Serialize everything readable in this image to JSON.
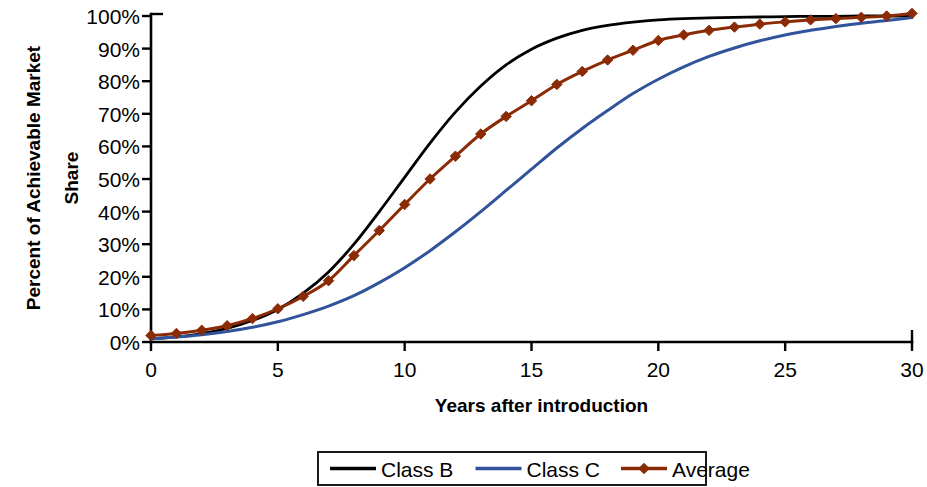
{
  "chart_data": {
    "type": "line",
    "title": "",
    "xlabel": "Years after introduction",
    "ylabel": "Percent of Achievable Market Share",
    "ylabel_lines": [
      "Percent of Achievable Market",
      "Share"
    ],
    "xlim": [
      0,
      30
    ],
    "ylim": [
      0,
      100
    ],
    "x_ticks": [
      0,
      5,
      10,
      15,
      20,
      25,
      30
    ],
    "x_tick_labels": [
      "0",
      "5",
      "10",
      "15",
      "20",
      "25",
      "30"
    ],
    "x_minor_ticks": [
      0,
      5,
      10,
      15,
      20,
      25,
      30
    ],
    "y_ticks": [
      0,
      10,
      20,
      30,
      40,
      50,
      60,
      70,
      80,
      90,
      100
    ],
    "y_tick_labels": [
      "0%",
      "10%",
      "20%",
      "30%",
      "40%",
      "50%",
      "60%",
      "70%",
      "80%",
      "90%",
      "100%"
    ],
    "grid": false,
    "legend_position": "bottom",
    "x": [
      0,
      1,
      2,
      3,
      4,
      5,
      6,
      7,
      8,
      9,
      10,
      11,
      12,
      13,
      14,
      15,
      16,
      17,
      18,
      19,
      20,
      21,
      22,
      23,
      24,
      25,
      26,
      27,
      28,
      29,
      30
    ],
    "series": [
      {
        "name": "Class B",
        "color": "#000000",
        "marker": "none",
        "line_width": 2.8,
        "values": [
          1.0,
          1.6,
          2.6,
          4.2,
          6.6,
          10.0,
          15.0,
          21.5,
          30.0,
          40.0,
          50.5,
          61.0,
          70.5,
          78.5,
          85.0,
          89.8,
          93.2,
          95.6,
          97.1,
          98.1,
          98.8,
          99.2,
          99.4,
          99.6,
          99.7,
          99.8,
          99.9,
          99.9,
          100.0,
          100.0,
          100.0
        ]
      },
      {
        "name": "Class C",
        "color": "#31539B",
        "marker": "none",
        "line_width": 3.0,
        "values": [
          1.0,
          1.5,
          2.2,
          3.2,
          4.5,
          6.2,
          8.4,
          11.0,
          14.2,
          18.2,
          22.8,
          28.0,
          33.8,
          40.0,
          46.5,
          53.0,
          59.5,
          65.5,
          71.0,
          76.2,
          80.6,
          84.4,
          87.6,
          90.2,
          92.4,
          94.2,
          95.6,
          96.8,
          97.8,
          98.6,
          99.5
        ]
      },
      {
        "name": "Average",
        "color": "#8B2B06",
        "marker": "diamond",
        "line_width": 3.0,
        "values": [
          2.0,
          2.6,
          3.6,
          5.0,
          7.2,
          10.2,
          14.0,
          18.8,
          26.5,
          34.2,
          42.2,
          50.0,
          57.0,
          63.8,
          69.2,
          74.0,
          79.0,
          83.0,
          86.5,
          89.5,
          92.5,
          94.2,
          95.6,
          96.6,
          97.5,
          98.2,
          98.8,
          99.2,
          99.6,
          100.0,
          100.8
        ]
      }
    ]
  },
  "legend": {
    "entries": [
      {
        "label": "Class B",
        "color": "#000000",
        "marker": "none"
      },
      {
        "label": "Class C",
        "color": "#31539B",
        "marker": "none"
      },
      {
        "label": "Average",
        "color": "#8B2B06",
        "marker": "diamond"
      }
    ]
  }
}
